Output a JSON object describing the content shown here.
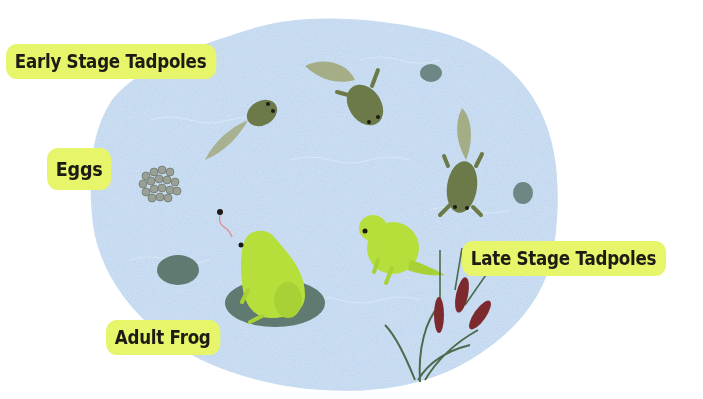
{
  "labels": {
    "early_stage_tadpoles": "Early Stage Tadpoles",
    "eggs": "Eggs",
    "late_stage_tadpoles": "Late Stage Tadpoles",
    "adult_frog": "Adult Frog"
  },
  "stages": [
    {
      "name": "Eggs",
      "icon": "frogspawn-icon"
    },
    {
      "name": "Early Stage Tadpoles",
      "icon": "tadpole-icon"
    },
    {
      "name": "Late Stage Tadpoles",
      "icon": "froglet-icon"
    },
    {
      "name": "Adult Frog",
      "icon": "frog-icon"
    }
  ],
  "colors": {
    "label_bg": "#e6f56a",
    "label_text": "#1c1c14",
    "pond": "#b9d3ee",
    "lily_pad": "#5f7a70",
    "tadpole": "#6b7a48",
    "frog": "#b7df3c",
    "cattail": "#7d2a2f",
    "reed": "#4d6b4c"
  }
}
